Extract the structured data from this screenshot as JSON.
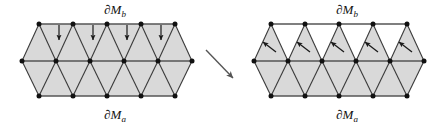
{
  "figure": {
    "title_text": "",
    "colors": {
      "shaded_fill": "#d9d9d9",
      "unshaded_fill": "#ffffff",
      "edge_stroke": "#3a3a3a",
      "boundary_stroke": "#555555",
      "vertex_fill": "#111111",
      "arrow_color": "#1a1a1a",
      "label_color": "#111111",
      "background": "#ffffff"
    },
    "labels": {
      "boundary_b": "∂M",
      "boundary_b_sub": "b",
      "boundary_a": "∂M",
      "boundary_a_sub": "a"
    },
    "panels": [
      {
        "id": "left-mesh",
        "name": "before-flip-triangulation",
        "origin_x": 22,
        "top_y": 24,
        "mid_y": 61,
        "bot_y": 96,
        "spacing": 34,
        "mid_vertex_count": 6,
        "rim_vertex_count": 5,
        "upper_band_shading": "all-shaded",
        "lower_band_shading": "all-shaded",
        "arrow_style": "vertical-down",
        "arrow_count": 4,
        "arrow_xs": [
          59,
          93,
          127,
          161
        ],
        "arrow_y_start": 25,
        "arrow_y_end": 41,
        "label_b_x": 115,
        "label_b_y": 14,
        "label_a_x": 115,
        "label_a_y": 118
      },
      {
        "id": "right-mesh",
        "name": "after-flip-triangulation",
        "origin_x": 254,
        "top_y": 24,
        "mid_y": 61,
        "bot_y": 96,
        "spacing": 34,
        "mid_vertex_count": 6,
        "rim_vertex_count": 5,
        "upper_band_shading": "up-triangles-shaded",
        "lower_band_shading": "all-shaded",
        "arrow_style": "diagonal-up-left",
        "arrow_count": 5,
        "arrow_xs": [
          271,
          305,
          339,
          373,
          407
        ],
        "arrow_y_start": 53,
        "arrow_y_end": 41,
        "label_b_x": 347,
        "label_b_y": 14,
        "label_a_x": 347,
        "label_a_y": 118
      }
    ],
    "transition_arrow": {
      "name": "transition-arrow",
      "x1": 206,
      "y1": 50,
      "x2": 235,
      "y2": 80,
      "direction": "down-right"
    }
  }
}
